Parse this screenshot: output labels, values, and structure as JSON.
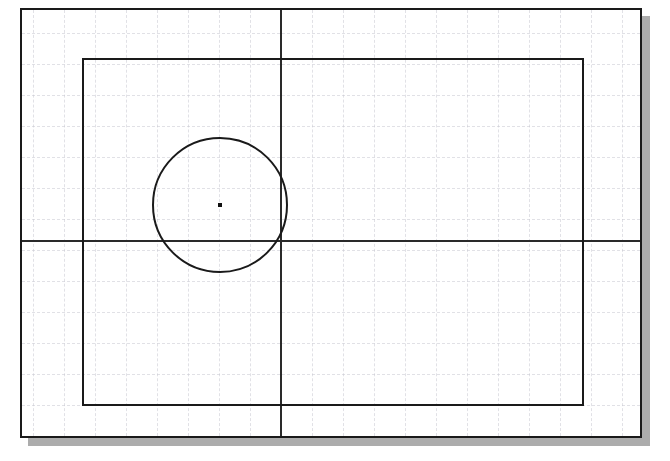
{
  "canvas": {
    "width": 670,
    "height": 461,
    "background_color": "#ffffff",
    "description": "CAD sketch viewport showing a rectangular profile with a circle feature"
  },
  "sheet": {
    "name": "drawing-sheet",
    "x": 20,
    "y": 8,
    "width": 622,
    "height": 430,
    "border_color": "#1a1a1a",
    "border_width": 2,
    "fill_color": "#ffffff"
  },
  "shadow": {
    "name": "sheet-drop-shadow",
    "offset_x": 8,
    "offset_y": 8,
    "color": "#9e9e9e"
  },
  "grid": {
    "name": "construction-grid",
    "spacing": 31,
    "color": "#c9c9d2",
    "style": "dashed",
    "visible": true,
    "vertical_positions": [
      11,
      42,
      73,
      104,
      135,
      166,
      197,
      228,
      259,
      290,
      321,
      352,
      383,
      414,
      445,
      476,
      507,
      538,
      569,
      600
    ],
    "horizontal_positions": [
      23,
      54,
      85,
      116,
      147,
      178,
      209,
      240,
      271,
      302,
      333,
      364,
      395,
      426
    ]
  },
  "axes": {
    "vertical": {
      "name": "vertical-reference-axis",
      "x": 258,
      "color": "#2a2a2a",
      "width": 2
    },
    "horizontal": {
      "name": "horizontal-reference-axis",
      "y": 230,
      "color": "#2a2a2a",
      "width": 2
    }
  },
  "profile_rectangle": {
    "name": "profile-rectangle",
    "x": 60,
    "y": 48,
    "width": 502,
    "height": 348,
    "stroke_color": "#1a1a1a",
    "stroke_width": 2
  },
  "circle_feature": {
    "name": "circle-feature",
    "center_x": 198,
    "center_y": 195,
    "radius": 68,
    "diameter": 136,
    "stroke_color": "#1a1a1a",
    "stroke_width": 2
  },
  "center_mark": {
    "name": "circle-center-point",
    "x": 198,
    "y": 195,
    "size": 4,
    "color": "#111111"
  }
}
